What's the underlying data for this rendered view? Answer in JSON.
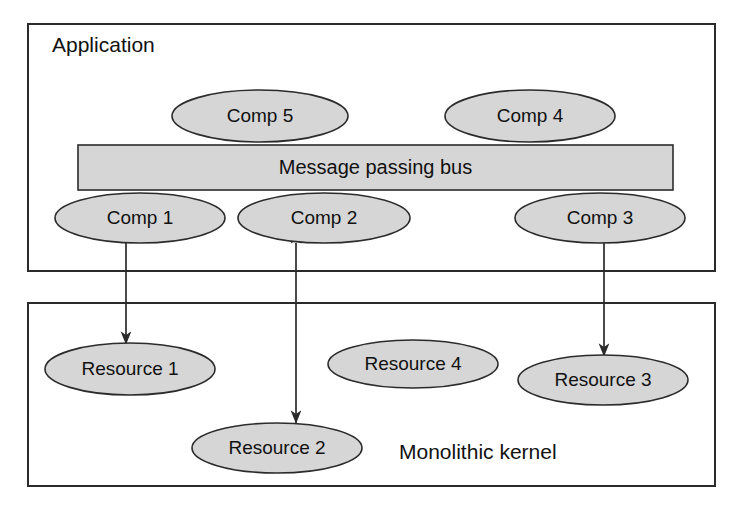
{
  "diagram": {
    "background_color": "#ffffff",
    "stroke_color": "#2b2b2b",
    "shape_fill_color": "#d6d6d6",
    "text_color": "#111111",
    "zones": [
      {
        "id": "application",
        "label": "Application",
        "label_x": 52,
        "label_y": 46,
        "x": 28,
        "y": 24,
        "width": 687,
        "height": 247
      },
      {
        "id": "kernel",
        "label": "Monolithic kernel",
        "label_x": 399,
        "label_y": 453,
        "x": 28,
        "y": 303,
        "width": 687,
        "height": 183
      }
    ],
    "bus": {
      "id": "message-passing-bus",
      "label": "Message passing bus",
      "x": 78,
      "y": 145,
      "width": 595,
      "height": 45
    },
    "components": [
      {
        "id": "comp-5",
        "label": "Comp 5",
        "cx": 260,
        "cy": 116,
        "rx": 88,
        "ry": 26
      },
      {
        "id": "comp-4",
        "label": "Comp 4",
        "cx": 530,
        "cy": 116,
        "rx": 85,
        "ry": 26
      },
      {
        "id": "comp-1",
        "label": "Comp 1",
        "cx": 140,
        "cy": 218,
        "rx": 85,
        "ry": 25
      },
      {
        "id": "comp-2",
        "label": "Comp 2",
        "cx": 324,
        "cy": 218,
        "rx": 86,
        "ry": 25
      },
      {
        "id": "comp-3",
        "label": "Comp 3",
        "cx": 600,
        "cy": 218,
        "rx": 85,
        "ry": 25
      }
    ],
    "resources": [
      {
        "id": "resource-1",
        "label": "Resource 1",
        "cx": 130,
        "cy": 369,
        "rx": 85,
        "ry": 26
      },
      {
        "id": "resource-4",
        "label": "Resource 4",
        "cx": 413,
        "cy": 364,
        "rx": 85,
        "ry": 24
      },
      {
        "id": "resource-3",
        "label": "Resource 3",
        "cx": 603,
        "cy": 380,
        "rx": 85,
        "ry": 25
      },
      {
        "id": "resource-2",
        "label": "Resource 2",
        "cx": 277,
        "cy": 448,
        "rx": 85,
        "ry": 25
      }
    ],
    "connections": [
      {
        "id": "comp1-resource1",
        "from": "comp-1",
        "to": "resource-1",
        "x": 126,
        "y1": 243,
        "y2": 344,
        "double_headed": true
      },
      {
        "id": "comp2-resource2",
        "from": "comp-2",
        "to": "resource-2",
        "x": 296,
        "y1": 243,
        "y2": 423,
        "double_headed": true
      },
      {
        "id": "comp3-resource3",
        "from": "comp-3",
        "to": "resource-3",
        "x": 604,
        "y1": 243,
        "y2": 356,
        "double_headed": true
      }
    ]
  }
}
